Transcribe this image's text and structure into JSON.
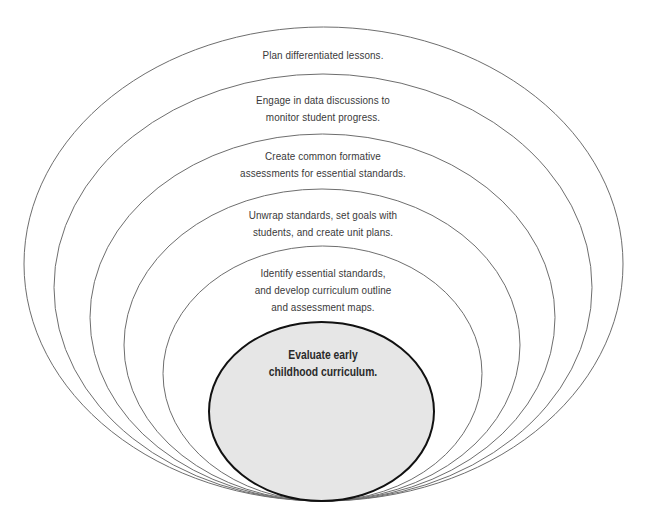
{
  "diagram": {
    "type": "nested-ellipses",
    "stroke_color": "#6e6e6e",
    "core_stroke_color": "#111111",
    "core_fill_color": "#e6e6e6",
    "rings": [
      {
        "level": 1,
        "lines": [
          "Plan differentiated lessons."
        ]
      },
      {
        "level": 2,
        "lines": [
          "Engage in data discussions to",
          "monitor student progress."
        ]
      },
      {
        "level": 3,
        "lines": [
          "Create common formative",
          "assessments for essential standards."
        ]
      },
      {
        "level": 4,
        "lines": [
          "Unwrap standards, set goals with",
          "students, and create unit plans."
        ]
      },
      {
        "level": 5,
        "lines": [
          "Identify essential standards,",
          "and develop curriculum outline",
          "and assessment maps."
        ]
      }
    ],
    "core": {
      "lines": [
        "Evaluate early",
        "childhood curriculum."
      ]
    }
  }
}
